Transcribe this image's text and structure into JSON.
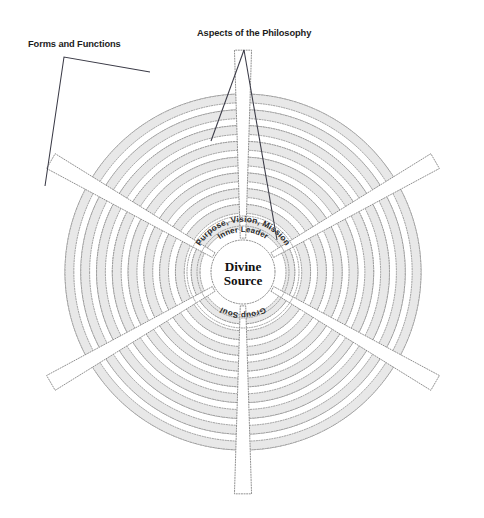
{
  "figure": {
    "type": "concentric-radial-diagram",
    "background_color": "#ffffff",
    "ring_fill_color": "#e8e8e8",
    "ring_stroke_color": "#8c8c8c",
    "spoke_fill_color": "#ffffff",
    "text_color": "#1c1c1c",
    "leader_line_color": "#3a3a46"
  },
  "callouts": [
    {
      "id": "forms-and-functions",
      "label": "Forms and Functions",
      "text_x": 28,
      "text_y": 47,
      "leader_points": "68,57 68,57"
    },
    {
      "id": "aspects-of-the-philosophy",
      "label": "Aspects of the Philosophy",
      "text_x": 197,
      "text_y": 36,
      "leader_points": "244,45 244,45"
    }
  ],
  "center": {
    "line1": "Divine",
    "line2": "Source",
    "cx": 243,
    "cy": 272,
    "radius": 32
  },
  "arc_labels": [
    {
      "id": "purpose-vision-mission",
      "text": "Purpose, Vision, Mission",
      "radius": 50,
      "position": "top"
    },
    {
      "id": "inner-leader",
      "text": "Inner Leader",
      "radius": 40,
      "position": "top"
    },
    {
      "id": "group-soul",
      "text": "Group Soul",
      "radius": 40,
      "position": "bottom"
    }
  ],
  "chart_data": {
    "type": "radial",
    "title": "",
    "center_label": "Divine Source",
    "rings_count": 9,
    "spokes_count": 6,
    "spoke_angles_deg": [
      30,
      90,
      150,
      210,
      270,
      330
    ],
    "ring_inner_radius": 36,
    "ring_outer_radius": 178,
    "spoke_outer_radius": 222,
    "spoke_half_width_deg": 4.6,
    "categories": [
      "Divine Source",
      "Inner Leader",
      "Purpose, Vision, Mission",
      "Group Soul",
      "Aspects of the Philosophy",
      "Forms and Functions"
    ]
  }
}
